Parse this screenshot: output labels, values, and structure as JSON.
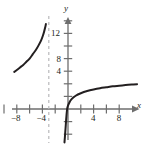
{
  "chart_data": {
    "type": "line",
    "title": "",
    "xlabel": "x",
    "ylabel": "y",
    "xlim": [
      -10.6,
      11.8
    ],
    "ylim": [
      -5.6,
      17.0
    ],
    "grid": false,
    "legend": null,
    "x_ticks": [
      -10,
      -8,
      -6,
      -4,
      -2,
      2,
      4,
      6,
      8,
      10
    ],
    "y_ticks": [
      2,
      4,
      6,
      8,
      10,
      12,
      14
    ],
    "x_tick_labels": [
      "-8",
      "-4",
      "4",
      "8"
    ],
    "x_tick_label_values": [
      -8,
      -4,
      4,
      8
    ],
    "y_tick_labels": [
      "4",
      "8",
      "12"
    ],
    "y_tick_label_values": [
      4,
      8,
      12
    ],
    "tick_interval": 2,
    "asymptotes": [
      {
        "type": "vertical",
        "x": -3,
        "style": "dashed"
      }
    ],
    "series": [
      {
        "name": "left-branch",
        "points": [
          [
            -8.4,
            5.9
          ],
          [
            -8.0,
            6.2
          ],
          [
            -7.5,
            6.6
          ],
          [
            -7.0,
            7.0
          ],
          [
            -6.5,
            7.5
          ],
          [
            -6.0,
            8.0
          ],
          [
            -5.5,
            8.7
          ],
          [
            -5.0,
            9.4
          ],
          [
            -4.6,
            10.1
          ],
          [
            -4.2,
            10.9
          ],
          [
            -3.9,
            11.7
          ],
          [
            -3.7,
            12.4
          ],
          [
            -3.55,
            13.0
          ],
          [
            -3.45,
            13.5
          ]
        ]
      },
      {
        "name": "right-branch",
        "points": [
          [
            -0.55,
            -5.3
          ],
          [
            -0.45,
            -4.0
          ],
          [
            -0.35,
            -2.6
          ],
          [
            -0.25,
            -1.2
          ],
          [
            -0.1,
            0.2
          ],
          [
            0.2,
            1.0
          ],
          [
            0.6,
            1.6
          ],
          [
            1.2,
            2.1
          ],
          [
            2.0,
            2.5
          ],
          [
            3.0,
            2.85
          ],
          [
            4.0,
            3.1
          ],
          [
            5.0,
            3.3
          ],
          [
            6.0,
            3.45
          ],
          [
            7.0,
            3.6
          ],
          [
            8.0,
            3.7
          ],
          [
            9.0,
            3.8
          ],
          [
            10.0,
            3.88
          ],
          [
            10.8,
            3.94
          ]
        ]
      }
    ]
  },
  "labels": {
    "x_axis": "x",
    "y_axis": "y",
    "x_neg8": "−8",
    "x_neg4": "−4",
    "x_pos4": "4",
    "x_pos8": "8",
    "y_4": "4",
    "y_8": "8",
    "y_12": "12"
  },
  "colors": {
    "curve": "#231f20",
    "axis": "#6e6e6e",
    "asymptote": "#b9b9bb",
    "text": "#231f20",
    "background": "#ffffff"
  }
}
